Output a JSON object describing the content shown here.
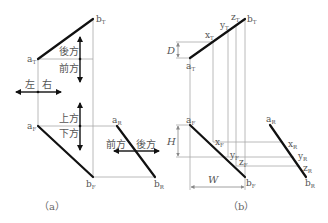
{
  "figure": {
    "panel_a": {
      "caption": "（a）",
      "points": {
        "a_T": {
          "base": "a",
          "sub": "T"
        },
        "b_T": {
          "base": "b",
          "sub": "T"
        },
        "a_F": {
          "base": "a",
          "sub": "F"
        },
        "b_F": {
          "base": "b",
          "sub": "F"
        },
        "a_R": {
          "base": "a",
          "sub": "R"
        },
        "b_R": {
          "base": "b",
          "sub": "R"
        }
      },
      "direction_labels": {
        "back_top": "後方",
        "front_top": "前方",
        "left": "左",
        "right": "右",
        "up": "上方",
        "down": "下方",
        "front_side": "前方",
        "back_side": "後方"
      }
    },
    "panel_b": {
      "caption": "（b）",
      "points": {
        "a_T": {
          "base": "a",
          "sub": "T"
        },
        "b_T": {
          "base": "b",
          "sub": "T"
        },
        "x_T": {
          "base": "x",
          "sub": "T"
        },
        "y_T": {
          "base": "y",
          "sub": "T"
        },
        "z_T": {
          "base": "z",
          "sub": "T"
        },
        "a_F": {
          "base": "a",
          "sub": "F"
        },
        "b_F": {
          "base": "b",
          "sub": "F"
        },
        "x_F": {
          "base": "x",
          "sub": "F"
        },
        "y_F": {
          "base": "y",
          "sub": "F"
        },
        "z_F": {
          "base": "z",
          "sub": "F"
        },
        "a_R": {
          "base": "a",
          "sub": "R"
        },
        "b_R": {
          "base": "b",
          "sub": "R"
        },
        "x_R": {
          "base": "x",
          "sub": "R"
        },
        "y_R": {
          "base": "y",
          "sub": "R"
        },
        "z_R": {
          "base": "z",
          "sub": "R"
        }
      },
      "dimensions": {
        "depth": "D",
        "height": "H",
        "width": "W"
      }
    }
  }
}
